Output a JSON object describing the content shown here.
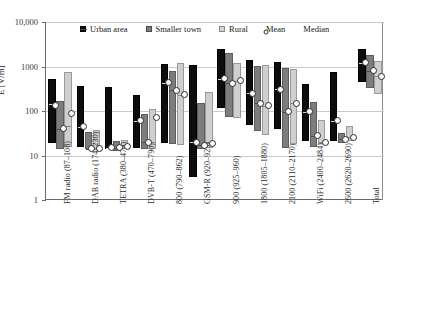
{
  "chart_data": {
    "type": "bar",
    "title": "",
    "subtitle": "",
    "xlabel": "",
    "ylabel": "E [V/m]",
    "yscale": "log",
    "ylim": [
      1,
      10000
    ],
    "yticks": [
      "1",
      "10",
      "100",
      "1000",
      "10,000"
    ],
    "ytick_values": [
      1,
      10,
      100,
      1000,
      10000
    ],
    "grid": true,
    "legend_position": "top-inside",
    "legend": [
      {
        "label": "Urban area",
        "marker": "filled-square",
        "color": "#0d0d0d"
      },
      {
        "label": "Smaller town",
        "marker": "filled-square",
        "color": "#7d7d7d"
      },
      {
        "label": "Rural",
        "marker": "filled-square",
        "color": "#d4d4d4"
      },
      {
        "label": "Mean",
        "marker": "open-circle",
        "color": "#ffffff"
      },
      {
        "label": "Median",
        "marker": "dash",
        "color": "#444444"
      }
    ],
    "categories": [
      "FM radio (87–108)",
      "DAB radio (174–230)",
      "TETRA (380–470)",
      "DVB-T (470–790)",
      "800 (790–862)",
      "GSM-R (920–925)",
      "900 (925–960)",
      "1800 (1805–1880)",
      "2100 (2110–2170)",
      "WiFi (2400–2484)",
      "2600 (2620–2690)",
      "Total"
    ],
    "series": [
      {
        "name": "Urban area",
        "color": "#0d0d0d",
        "bars": [
          {
            "low": 18,
            "high": 510,
            "median": 140,
            "mean": 130
          },
          {
            "low": 15,
            "high": 340,
            "median": 44,
            "mean": 44
          },
          {
            "low": 13,
            "high": 330,
            "median": 15,
            "mean": 15
          },
          {
            "low": 14,
            "high": 215,
            "median": 60,
            "mean": 60
          },
          {
            "low": 18,
            "high": 1100,
            "median": 430,
            "mean": 430
          },
          {
            "low": 3.1,
            "high": 1050,
            "median": 20,
            "mean": 20
          },
          {
            "low": 110,
            "high": 2300,
            "median": 530,
            "mean": 530
          },
          {
            "low": 47,
            "high": 1300,
            "median": 250,
            "mean": 250
          },
          {
            "low": 38,
            "high": 1200,
            "median": 310,
            "mean": 310
          },
          {
            "low": 20,
            "high": 380,
            "median": 95,
            "mean": 95
          },
          {
            "low": 20,
            "high": 700,
            "median": 60,
            "mean": 60
          },
          {
            "low": 420,
            "high": 2400,
            "median": 1200,
            "mean": 1200
          }
        ]
      },
      {
        "name": "Smaller town",
        "color": "#7d7d7d",
        "bars": [
          {
            "low": 13,
            "high": 160,
            "median": 40,
            "mean": 40
          },
          {
            "low": 13,
            "high": 32,
            "median": 14,
            "mean": 14
          },
          {
            "low": 12,
            "high": 20,
            "median": 15,
            "mean": 15
          },
          {
            "low": 13,
            "high": 80,
            "median": 20,
            "mean": 20
          },
          {
            "low": 17,
            "high": 760,
            "median": 290,
            "mean": 290
          },
          {
            "low": 13,
            "high": 140,
            "median": 17,
            "mean": 17
          },
          {
            "low": 70,
            "high": 1900,
            "median": 420,
            "mean": 420
          },
          {
            "low": 33,
            "high": 1000,
            "median": 150,
            "mean": 150
          },
          {
            "low": 14,
            "high": 880,
            "median": 95,
            "mean": 95
          },
          {
            "low": 15,
            "high": 150,
            "median": 28,
            "mean": 28
          },
          {
            "low": 18,
            "high": 30,
            "median": 23,
            "mean": 23
          },
          {
            "low": 310,
            "high": 1700,
            "median": 800,
            "mean": 800
          }
        ]
      },
      {
        "name": "Rural",
        "color": "#d4d4d4",
        "bars": [
          {
            "low": 15,
            "high": 720,
            "median": 46,
            "mean": 90
          },
          {
            "low": 13,
            "high": 35,
            "median": 14,
            "mean": 14
          },
          {
            "low": 13,
            "high": 21,
            "median": 16,
            "mean": 16
          },
          {
            "low": 13,
            "high": 105,
            "median": 20,
            "mean": 72
          },
          {
            "low": 16,
            "high": 1130,
            "median": 230,
            "mean": 230
          },
          {
            "low": 14,
            "high": 260,
            "median": 19,
            "mean": 19
          },
          {
            "low": 65,
            "high": 1150,
            "median": 480,
            "mean": 480
          },
          {
            "low": 27,
            "high": 1050,
            "median": 130,
            "mean": 130
          },
          {
            "low": 17,
            "high": 840,
            "median": 150,
            "mean": 150
          },
          {
            "low": 17,
            "high": 60,
            "median": 20,
            "mean": 20
          },
          {
            "low": 20,
            "high": 44,
            "median": 26,
            "mean": 26
          },
          {
            "low": 230,
            "high": 1250,
            "median": 600,
            "mean": 600
          }
        ]
      }
    ]
  }
}
